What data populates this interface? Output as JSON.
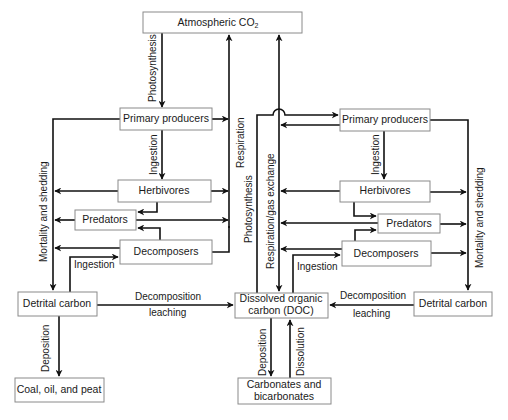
{
  "diagram": {
    "colors": {
      "line": "#111111",
      "box_border": "#8a8a8a",
      "text": "#1a1a1a",
      "background": "#ffffff"
    },
    "nodes": {
      "atmospheric_co2": {
        "label": "Atmospheric CO",
        "subscript": "2"
      },
      "left_primary_producers": {
        "label": "Primary producers"
      },
      "left_herbivores": {
        "label": "Herbivores"
      },
      "left_predators": {
        "label": "Predators"
      },
      "left_decomposers": {
        "label": "Decomposers"
      },
      "left_detrital_carbon": {
        "label": "Detrital carbon"
      },
      "coal_oil_peat": {
        "label": "Coal, oil, and peat"
      },
      "doc": {
        "line1": "Dissolved organic",
        "line2": "carbon (DOC)"
      },
      "carbonates": {
        "line1": "Carbonates and",
        "line2": "bicarbonates"
      },
      "right_primary_producers": {
        "label": "Primary producers"
      },
      "right_herbivores": {
        "label": "Herbivores"
      },
      "right_predators": {
        "label": "Predators"
      },
      "right_decomposers": {
        "label": "Decomposers"
      },
      "right_detrital_carbon": {
        "label": "Detrital carbon"
      }
    },
    "edge_labels": {
      "photosynthesis_left": "Photosynthesis",
      "respiration_left": "Respiration",
      "ingestion_left_pp": "Ingestion",
      "mortality_left": "Mortality and shedding",
      "ingestion_left_detrital": "Ingestion",
      "decomposition_left": "Decomposition",
      "leaching_left": "leaching",
      "deposition_left": "Deposition",
      "photosynthesis_center": "Photosynthesis",
      "respiration_gas_exchange": "Respiration/gas exchange",
      "ingestion_right_pp": "Ingestion",
      "mortality_right": "Mortality and shedding",
      "ingestion_right_doc": "Ingestion",
      "decomposition_right": "Decomposition",
      "leaching_right": "leaching",
      "deposition_center": "Deposition",
      "dissolution": "Dissolution"
    }
  }
}
